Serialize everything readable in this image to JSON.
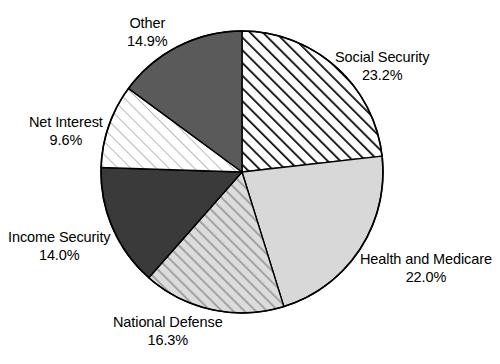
{
  "chart_data": {
    "type": "pie",
    "title": "",
    "subtitle": "",
    "xlabel": "",
    "ylabel": "",
    "legend_position": "none",
    "grid": false,
    "start_angle_deg": 0,
    "direction": "clockwise",
    "value_unit": "percent",
    "categories": [
      "Social Security",
      "Health and Medicare",
      "National Defense",
      "Income Security",
      "Net Interest",
      "Other"
    ],
    "values": [
      23.2,
      22.0,
      16.3,
      14.0,
      9.6,
      14.9
    ],
    "slices": [
      {
        "label": "Social Security",
        "value": 23.2,
        "value_text": "23.2%",
        "fill_style": "diagonal-hatch-bold",
        "fill_color": "#ffffff",
        "hatch_color": "#000000"
      },
      {
        "label": "Health and Medicare",
        "value": 22.0,
        "value_text": "22.0%",
        "fill_style": "solid",
        "fill_color": "#d8d8d8",
        "hatch_color": ""
      },
      {
        "label": "National Defense",
        "value": 16.3,
        "value_text": "16.3%",
        "fill_style": "diagonal-hatch-gray",
        "fill_color": "#d8d8d8",
        "hatch_color": "#9a9a9a"
      },
      {
        "label": "Income Security",
        "value": 14.0,
        "value_text": "14.0%",
        "fill_style": "solid",
        "fill_color": "#3a3a3a",
        "hatch_color": ""
      },
      {
        "label": "Net Interest",
        "value": 9.6,
        "value_text": "9.6%",
        "fill_style": "diagonal-hatch-fine",
        "fill_color": "#ffffff",
        "hatch_color": "#b0b0b0"
      },
      {
        "label": "Other",
        "value": 14.9,
        "value_text": "14.9%",
        "fill_style": "solid",
        "fill_color": "#5a5a5a",
        "hatch_color": ""
      }
    ],
    "geometry": {
      "center_x": 242,
      "center_y": 172,
      "radius": 141
    },
    "colors": {
      "outline": "#000000",
      "background": "#ffffff"
    }
  }
}
